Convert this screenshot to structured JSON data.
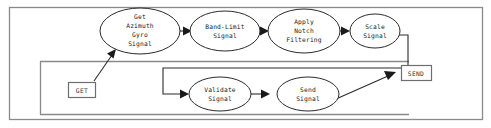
{
  "diagram": {
    "type": "flowchart",
    "canvas": {
      "width": 491,
      "height": 128
    },
    "colors": {
      "background": "#ffffff",
      "node_stroke": "#2b2b2b",
      "node_fill": "#ffffff",
      "edge": "#2b2b2b",
      "frame": "#8a8a8a",
      "io_box_stroke": "#6e6e6e",
      "text": "#1a1a1a"
    },
    "frames": [
      {
        "id": "outer-frame",
        "x": 9,
        "y": 7,
        "width": 474,
        "height": 113
      },
      {
        "id": "inner-frame",
        "x": 40,
        "y": 61,
        "width": 369,
        "height": 54
      }
    ],
    "process_nodes": [
      {
        "id": "get-azimuth-gyro-signal",
        "name": "get-azimuth-gyro-signal-node",
        "shape": "ellipse",
        "lines": [
          "Get",
          "Azimuth",
          "Gyro",
          "Signal"
        ],
        "cx": 140,
        "cy": 31,
        "rx": 40,
        "ry": 23
      },
      {
        "id": "band-limit-signal",
        "name": "band-limit-signal-node",
        "shape": "ellipse",
        "lines": [
          "Band-Limit",
          "Signal"
        ],
        "cx": 225,
        "cy": 31,
        "rx": 35,
        "ry": 20
      },
      {
        "id": "apply-notch-filtering",
        "name": "apply-notch-filtering-node",
        "shape": "ellipse",
        "lines": [
          "Apply",
          "Notch",
          "Filtering"
        ],
        "cx": 304,
        "cy": 31,
        "rx": 36,
        "ry": 22
      },
      {
        "id": "scale-signal",
        "name": "scale-signal-node",
        "shape": "ellipse",
        "lines": [
          "Scale",
          "Signal"
        ],
        "cx": 375,
        "cy": 31,
        "rx": 25,
        "ry": 17
      },
      {
        "id": "validate-signal",
        "name": "validate-signal-node",
        "shape": "ellipse",
        "lines": [
          "Validate",
          "Signal"
        ],
        "cx": 220,
        "cy": 94,
        "rx": 31,
        "ry": 17
      },
      {
        "id": "send-signal",
        "name": "send-signal-node",
        "shape": "ellipse",
        "lines": [
          "Send",
          "Signal"
        ],
        "cx": 308,
        "cy": 94,
        "rx": 31,
        "ry": 17
      }
    ],
    "io_nodes": [
      {
        "id": "get-terminal",
        "name": "get-terminal-box",
        "shape": "rect",
        "label": "GET",
        "x": 68,
        "y": 82,
        "width": 27,
        "height": 15
      },
      {
        "id": "send-terminal",
        "name": "send-terminal-box",
        "shape": "rect",
        "label": "SEND",
        "x": 401,
        "y": 65,
        "width": 30,
        "height": 15
      }
    ],
    "edges": [
      {
        "id": "edge-get-to-azimuth",
        "from": "get-terminal",
        "to": "get-azimuth-gyro-signal"
      },
      {
        "id": "edge-azimuth-to-bandlimit",
        "from": "get-azimuth-gyro-signal",
        "to": "band-limit-signal"
      },
      {
        "id": "edge-bandlimit-to-notch",
        "from": "band-limit-signal",
        "to": "apply-notch-filtering"
      },
      {
        "id": "edge-notch-to-scale",
        "from": "apply-notch-filtering",
        "to": "scale-signal"
      },
      {
        "id": "edge-scale-to-validate",
        "from": "scale-signal",
        "to": "validate-signal"
      },
      {
        "id": "edge-validate-to-send",
        "from": "validate-signal",
        "to": "send-signal"
      },
      {
        "id": "edge-send-to-sendterminal",
        "from": "send-signal",
        "to": "send-terminal"
      }
    ]
  }
}
